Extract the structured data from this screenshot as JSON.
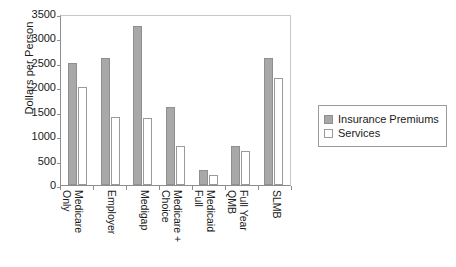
{
  "chart_data": {
    "type": "bar",
    "title": "",
    "xlabel": "",
    "ylabel": "Dollars per Person",
    "ylim": [
      0,
      3500
    ],
    "ytick_step": 500,
    "yticks": [
      "0",
      "500",
      "1000",
      "1500",
      "2000",
      "2500",
      "3000",
      "3500"
    ],
    "grid": false,
    "legend_position": "right",
    "categories": [
      "Medicare Only",
      "Employer",
      "Medigap",
      "Medicare + Choice",
      "Full Medicaid",
      "Full Year QMB",
      "SLMB"
    ],
    "category_lines": [
      {
        "line1": "Medicare",
        "line2": "Only"
      },
      {
        "line1": "Employer",
        "line2": ""
      },
      {
        "line1": "Medigap",
        "line2": ""
      },
      {
        "line1": "Medicare +",
        "line2": "Choice"
      },
      {
        "line1": "Medicaid",
        "line2": "Full"
      },
      {
        "line1": "Full Year",
        "line2": "QMB"
      },
      {
        "line1": "SLMB",
        "line2": ""
      }
    ],
    "series": [
      {
        "name": "Insurance Premiums",
        "color": "#a8a8a8",
        "values": [
          2500,
          2600,
          3250,
          1600,
          300,
          800,
          2590
        ]
      },
      {
        "name": "Services",
        "color": "#ffffff",
        "values": [
          2000,
          1400,
          1380,
          800,
          210,
          690,
          2190
        ]
      }
    ]
  },
  "legend": {
    "items": [
      {
        "label": "Insurance Premiums"
      },
      {
        "label": "Services"
      }
    ]
  },
  "colors": {
    "premiums": "#a8a8a8",
    "services": "#ffffff",
    "axis": "#8d8d8d",
    "frame": "#c9c9c9",
    "text": "#1a1a1a"
  }
}
